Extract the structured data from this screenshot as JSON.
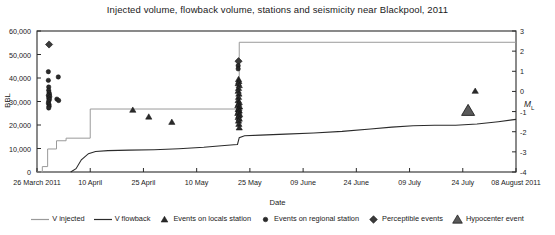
{
  "chart_data": {
    "type": "scatter",
    "title": "Injected volume, flowback volume, stations and seismicity near Blackpool, 2011",
    "xlabel": "Date",
    "ylabel": "BBL",
    "ylabel_right": "ML",
    "ylim": [
      0,
      60000
    ],
    "ylim_right": [
      -4,
      3
    ],
    "xlim_days": [
      0,
      135
    ],
    "grid": false,
    "legend_position": "bottom",
    "yticks": [
      "0",
      "10,000",
      "20,000",
      "30,000",
      "40,000",
      "50,000",
      "60,000"
    ],
    "ytick_values": [
      0,
      10000,
      20000,
      30000,
      40000,
      50000,
      60000
    ],
    "yticks_right": [
      "-4",
      "-3",
      "-2",
      "-1",
      "0",
      "1",
      "2",
      "3"
    ],
    "ytick_right_values": [
      -4,
      -3,
      -2,
      -1,
      0,
      1,
      2,
      3
    ],
    "xticks": [
      "26 March 2011",
      "10 April",
      "25 April",
      "10 May",
      "25 May",
      "09 June",
      "24 June",
      "09 July",
      "24 July",
      "08 August 2011"
    ],
    "xtick_days": [
      0,
      15,
      30,
      45,
      60,
      75,
      90,
      105,
      120,
      135
    ],
    "series": [
      {
        "name": "V injected",
        "type": "step",
        "color": "#9a9a9a",
        "axis": "left",
        "points": [
          [
            0,
            0
          ],
          [
            1.5,
            0
          ],
          [
            1.5,
            2300
          ],
          [
            3.0,
            2300
          ],
          [
            3.0,
            9800
          ],
          [
            5.5,
            9800
          ],
          [
            5.5,
            13300
          ],
          [
            8.2,
            13300
          ],
          [
            8.2,
            14400
          ],
          [
            15.0,
            14400
          ],
          [
            15.0,
            26800
          ],
          [
            57.0,
            26800
          ],
          [
            57.0,
            55200
          ],
          [
            135,
            55200
          ]
        ]
      },
      {
        "name": "V flowback",
        "type": "line",
        "color": "#2b2b2b",
        "axis": "left",
        "points": [
          [
            9.5,
            0
          ],
          [
            11.0,
            1400
          ],
          [
            12.5,
            5200
          ],
          [
            14.5,
            7800
          ],
          [
            16.5,
            8700
          ],
          [
            20.0,
            9100
          ],
          [
            26.0,
            9300
          ],
          [
            33.0,
            9500
          ],
          [
            40.0,
            9900
          ],
          [
            47.0,
            10500
          ],
          [
            52.0,
            11200
          ],
          [
            55.5,
            11600
          ],
          [
            56.5,
            11700
          ],
          [
            57.0,
            14600
          ],
          [
            58.5,
            15400
          ],
          [
            63.0,
            15700
          ],
          [
            70.0,
            16100
          ],
          [
            78.0,
            16600
          ],
          [
            86.0,
            17300
          ],
          [
            94.0,
            18300
          ],
          [
            100.0,
            19100
          ],
          [
            106.0,
            19700
          ],
          [
            112.0,
            19900
          ],
          [
            118.0,
            19900
          ],
          [
            124.0,
            20400
          ],
          [
            130.0,
            21400
          ],
          [
            135,
            22400
          ]
        ]
      }
    ],
    "events": [
      {
        "name": "Perceptible events",
        "marker": "diamond",
        "color": "#3a3a3a",
        "axis": "right",
        "points": [
          [
            3.4,
            2.33
          ],
          [
            56.8,
            1.5
          ]
        ]
      },
      {
        "name": "Events on regional station",
        "marker": "circle",
        "color": "#2b2b2b",
        "axis": "right",
        "points": [
          [
            3.2,
            0.98
          ],
          [
            3.2,
            0.55
          ],
          [
            3.3,
            0.22
          ],
          [
            3.3,
            0.06
          ],
          [
            3.4,
            -0.06
          ],
          [
            3.5,
            -0.14
          ],
          [
            3.2,
            -0.2
          ],
          [
            3.6,
            -0.26
          ],
          [
            3.3,
            -0.33
          ],
          [
            3.5,
            -0.4
          ],
          [
            3.3,
            -0.48
          ],
          [
            3.2,
            -0.58
          ],
          [
            3.4,
            -0.66
          ],
          [
            3.4,
            -0.74
          ],
          [
            3.3,
            -0.82
          ],
          [
            6.0,
            0.72
          ],
          [
            5.6,
            -0.38
          ],
          [
            6.1,
            -0.45
          ],
          [
            56.7,
            1.28
          ],
          [
            56.7,
            1.12
          ]
        ]
      },
      {
        "name": "Events on locals station",
        "marker": "triangle",
        "color": "#2b2b2b",
        "axis": "right",
        "points": [
          [
            27.0,
            -0.92
          ],
          [
            31.5,
            -1.26
          ],
          [
            38.0,
            -1.52
          ],
          [
            56.8,
            0.6
          ],
          [
            56.9,
            0.5
          ],
          [
            56.7,
            0.4
          ],
          [
            57.0,
            0.3
          ],
          [
            56.8,
            0.16
          ],
          [
            56.7,
            0.02
          ],
          [
            56.9,
            -0.12
          ],
          [
            56.8,
            -0.28
          ],
          [
            56.7,
            -0.44
          ],
          [
            57.0,
            -0.54
          ],
          [
            56.8,
            -0.62
          ],
          [
            56.6,
            -0.7
          ],
          [
            57.1,
            -0.76
          ],
          [
            56.9,
            -0.84
          ],
          [
            56.7,
            -0.9
          ],
          [
            57.0,
            -0.96
          ],
          [
            56.8,
            -1.02
          ],
          [
            56.6,
            -1.08
          ],
          [
            57.1,
            -1.14
          ],
          [
            56.9,
            -1.2
          ],
          [
            56.7,
            -1.28
          ],
          [
            57.0,
            -1.36
          ],
          [
            56.8,
            -1.46
          ],
          [
            56.9,
            -1.62
          ],
          [
            57.0,
            -1.8
          ],
          [
            123.5,
            0.02
          ]
        ]
      },
      {
        "name": "Hypocenter event",
        "marker": "triangle-large",
        "color": "#5a5a5a",
        "axis": "right",
        "points": [
          [
            121.5,
            -0.95
          ]
        ]
      }
    ],
    "legend": [
      {
        "label": "V injected",
        "marker": "line",
        "color": "#9a9a9a"
      },
      {
        "label": "V flowback",
        "marker": "line",
        "color": "#2b2b2b"
      },
      {
        "label": "Events on locals station",
        "marker": "triangle",
        "color": "#2b2b2b"
      },
      {
        "label": "Events on regional station",
        "marker": "circle",
        "color": "#2b2b2b"
      },
      {
        "label": "Perceptible events",
        "marker": "diamond",
        "color": "#3a3a3a"
      },
      {
        "label": "Hypocenter event",
        "marker": "triangle-large",
        "color": "#5a5a5a"
      }
    ]
  }
}
